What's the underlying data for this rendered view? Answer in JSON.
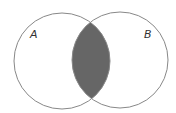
{
  "diagram": {
    "type": "venn",
    "sets": [
      {
        "label": "A",
        "cx": 62,
        "cy": 61,
        "r": 48
      },
      {
        "label": "B",
        "cx": 120,
        "cy": 60,
        "r": 48
      }
    ],
    "shaded_region": "A ∩ B",
    "colors": {
      "stroke": "#888888",
      "shade": "#666666",
      "background": "#ffffff"
    }
  }
}
